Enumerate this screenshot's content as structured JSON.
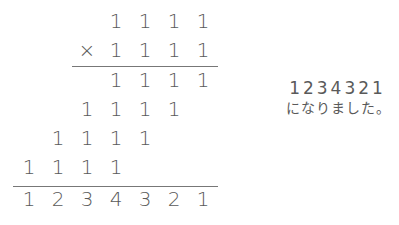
{
  "calculation": {
    "multiplicand": [
      "1",
      "1",
      "1",
      "1"
    ],
    "operator": "×",
    "multiplier": [
      "1",
      "1",
      "1",
      "1"
    ],
    "partial_products": [
      [
        "1",
        "1",
        "1",
        "1"
      ],
      [
        "1",
        "1",
        "1",
        "1"
      ],
      [
        "1",
        "1",
        "1",
        "1"
      ],
      [
        "1",
        "1",
        "1",
        "1"
      ]
    ],
    "result": [
      "1",
      "2",
      "3",
      "4",
      "3",
      "2",
      "1"
    ]
  },
  "note": {
    "value": "1234321",
    "caption": "になりました。"
  }
}
